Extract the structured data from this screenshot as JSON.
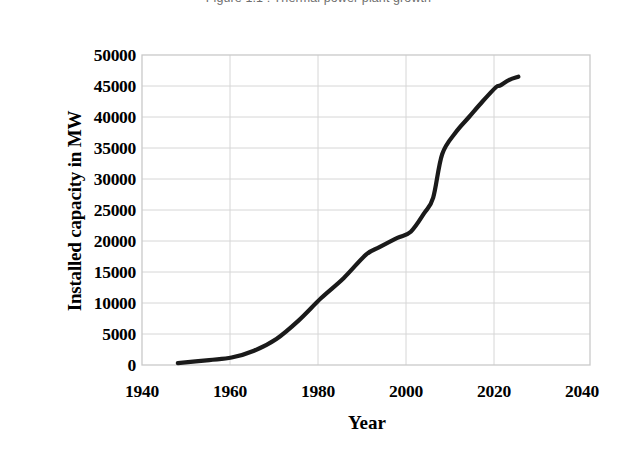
{
  "caption": "Figure 1.1 : Thermal power plant growth",
  "chart_data": {
    "type": "line",
    "title": "",
    "xlabel": "Year",
    "ylabel": "Installed capacity in MW",
    "xlim": [
      1940,
      2040
    ],
    "ylim": [
      0,
      50000
    ],
    "xticks": [
      1940,
      1960,
      1980,
      2000,
      2020,
      2040
    ],
    "yticks": [
      0,
      5000,
      10000,
      15000,
      20000,
      25000,
      30000,
      35000,
      40000,
      45000,
      50000
    ],
    "grid": true,
    "legend": "none",
    "line_color": "#1a1a1a",
    "series": [
      {
        "name": "Installed capacity",
        "x": [
          1948,
          1955,
          1960,
          1965,
          1970,
          1975,
          1980,
          1985,
          1990,
          1993,
          1997,
          2000,
          2003,
          2005,
          2007,
          2010,
          2013,
          2016,
          2019,
          2020,
          2022,
          2024
        ],
        "values": [
          300,
          800,
          1200,
          2300,
          4200,
          7200,
          10800,
          14000,
          17800,
          19000,
          20500,
          21500,
          24500,
          27000,
          34000,
          37500,
          40000,
          42500,
          44800,
          45100,
          46000,
          46500
        ]
      }
    ]
  }
}
